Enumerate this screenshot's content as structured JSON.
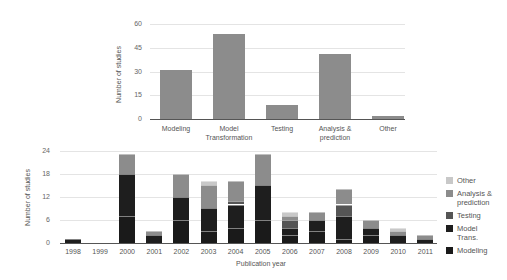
{
  "chart_data": [
    {
      "type": "bar",
      "title": "",
      "xlabel": "",
      "ylabel": "Number of studies",
      "ylim": [
        0,
        60
      ],
      "yticks": [
        0,
        15,
        30,
        45,
        60
      ],
      "grid": true,
      "categories": [
        "Modeling",
        "Model Transformation",
        "Testing",
        "Analysis & prediction",
        "Other"
      ],
      "values": [
        31,
        54,
        9,
        41,
        2
      ],
      "color": "#8c8c8c"
    },
    {
      "type": "bar",
      "stacked": true,
      "title": "",
      "xlabel": "Publication year",
      "ylabel": "Number of studies",
      "ylim": [
        0,
        24
      ],
      "yticks": [
        0,
        6,
        12,
        18,
        24
      ],
      "grid": true,
      "legend_position": "right",
      "categories": [
        "1998",
        "1999",
        "2000",
        "2001",
        "2002",
        "2003",
        "2004",
        "2005",
        "2006",
        "2007",
        "2008",
        "2009",
        "2010",
        "2011"
      ],
      "series": [
        {
          "name": "Modeling",
          "color": "#1a1a1a",
          "values": [
            0,
            0,
            7,
            0,
            6,
            3,
            4,
            6,
            2,
            3,
            1,
            2,
            0,
            0
          ]
        },
        {
          "name": "Model Trans.",
          "color": "#1e1e1e",
          "values": [
            1,
            0,
            11,
            2,
            6,
            6,
            6,
            9,
            2,
            3,
            6,
            2,
            2,
            1
          ]
        },
        {
          "name": "Testing",
          "color": "#555555",
          "values": [
            0,
            0,
            0,
            0,
            0,
            0,
            1,
            0,
            2,
            0,
            3,
            0,
            0,
            0
          ]
        },
        {
          "name": "Analysis & prediction",
          "color": "#8c8c8c",
          "values": [
            0,
            0,
            5,
            1,
            6,
            6,
            5,
            8,
            1,
            2,
            4,
            2,
            1,
            1
          ]
        },
        {
          "name": "Other",
          "color": "#c8c8c8",
          "values": [
            0,
            0,
            0,
            0,
            0,
            1,
            0,
            0,
            1,
            0,
            0,
            0,
            1,
            0
          ]
        }
      ],
      "totals": [
        1,
        0,
        23,
        3,
        18,
        16,
        16,
        23,
        8,
        8,
        14,
        6,
        4,
        2
      ]
    }
  ],
  "top": {
    "ylabel": "Number of studies",
    "yticks": [
      "60",
      "45",
      "30",
      "15",
      "0"
    ],
    "labels": [
      "Modeling",
      "Model\nTransformation",
      "Testing",
      "Analysis &\nprediction",
      "Other"
    ]
  },
  "bottom": {
    "ylabel": "Number of studies",
    "xlabel": "Publication year",
    "yticks": [
      "24",
      "18",
      "12",
      "6",
      "0"
    ],
    "legend": [
      {
        "label": "Other",
        "color": "#c8c8c8"
      },
      {
        "label": "Analysis &\nprediction",
        "color": "#8c8c8c"
      },
      {
        "label": "Testing",
        "color": "#555555"
      },
      {
        "label": "Model\nTrans.",
        "color": "#1e1e1e"
      },
      {
        "label": "Modeling",
        "color": "#1a1a1a"
      }
    ]
  }
}
